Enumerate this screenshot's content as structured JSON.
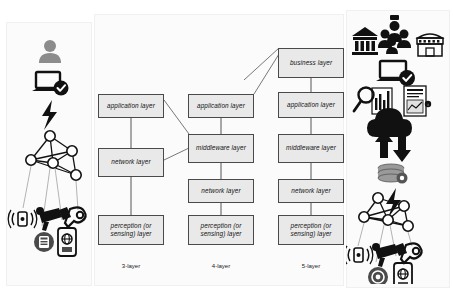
{
  "diagram": {
    "columns": [
      {
        "id": "three-layer",
        "caption": "3-layer",
        "boxes": [
          {
            "id": "app",
            "label": "application layer"
          },
          {
            "id": "network",
            "label": "network layer"
          },
          {
            "id": "perception",
            "label": "perception (or sensing) layer"
          }
        ]
      },
      {
        "id": "four-layer",
        "caption": "4-layer",
        "boxes": [
          {
            "id": "app",
            "label": "application layer"
          },
          {
            "id": "middleware",
            "label": "middleware layer"
          },
          {
            "id": "network",
            "label": "network layer"
          },
          {
            "id": "perception",
            "label": "perception (or sensing) layer"
          }
        ]
      },
      {
        "id": "five-layer",
        "caption": "5-layer",
        "boxes": [
          {
            "id": "business",
            "label": "business layer"
          },
          {
            "id": "app",
            "label": "application layer"
          },
          {
            "id": "middleware",
            "label": "middleware layer"
          },
          {
            "id": "network",
            "label": "network layer"
          },
          {
            "id": "perception",
            "label": "perception (or sensing) layer"
          }
        ]
      }
    ],
    "icons": {
      "left": [
        "user-avatar-icon",
        "laptop-check-icon",
        "lightning-bolt-icon",
        "mesh-network-icon",
        "wireless-sensor-icon",
        "cctv-camera-icon",
        "rfid-tag-icon",
        "coin-chip-icon",
        "smartphone-globe-icon"
      ],
      "right": [
        "bank-building-icon",
        "people-group-icon",
        "storefront-icon",
        "laptop-check-icon",
        "magnifier-chart-icon",
        "report-document-icon",
        "cloud-sync-icon",
        "database-gear-icon",
        "lightning-bolt-icon",
        "mesh-network-icon",
        "wireless-sensor-icon",
        "cctv-camera-icon",
        "rfid-tag-icon",
        "coin-chip-icon",
        "smartphone-globe-icon"
      ]
    },
    "colors": {
      "box_fill": "#e9e9e9",
      "box_border": "#4a4a4a",
      "line": "#555555",
      "icon_dark": "#111111",
      "icon_gray": "#8c8c8c",
      "background": "#ffffff"
    }
  }
}
